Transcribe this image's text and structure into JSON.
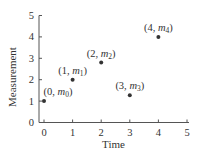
{
  "chart_data": {
    "type": "scatter",
    "title": "",
    "xlabel": "Time",
    "ylabel": "Measurement",
    "xlim": [
      0,
      5
    ],
    "ylim": [
      0,
      5
    ],
    "xticks": [
      "0",
      "1",
      "2",
      "3",
      "4",
      "5"
    ],
    "yticks": [
      "0",
      "1",
      "2",
      "3",
      "4",
      "5"
    ],
    "grid": false,
    "points": [
      {
        "x": 0,
        "y": 1.0,
        "label_prefix": "(0, ",
        "label_var": "m",
        "label_sub": "0",
        "label_suffix": ")"
      },
      {
        "x": 1,
        "y": 2.0,
        "label_prefix": "(1, ",
        "label_var": "m",
        "label_sub": "1",
        "label_suffix": ")"
      },
      {
        "x": 2,
        "y": 2.8,
        "label_prefix": "(2, ",
        "label_var": "m",
        "label_sub": "2",
        "label_suffix": ")"
      },
      {
        "x": 3,
        "y": 1.27,
        "label_prefix": "(3, ",
        "label_var": "m",
        "label_sub": "3",
        "label_suffix": ")"
      },
      {
        "x": 4,
        "y": 4.0,
        "label_prefix": "(4, ",
        "label_var": "m",
        "label_sub": "4",
        "label_suffix": ")"
      }
    ],
    "marker_color": "#333333"
  }
}
